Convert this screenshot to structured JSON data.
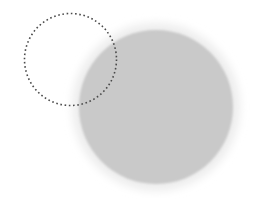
{
  "canvas": {
    "width": 253,
    "height": 199,
    "background_color": "#ffffff",
    "label": "image-canvas"
  },
  "shapes": {
    "filled_circle": {
      "name": "gray-filled-circle",
      "cx": 156,
      "cy": 107,
      "r": 77,
      "fill_color": "#c9c9c9",
      "edge_blur_px": 2
    },
    "halo_ring": {
      "name": "light-halo-ring",
      "cx": 156,
      "cy": 107,
      "r": 84,
      "fill_color": "#ededed",
      "blur_px": 4
    },
    "dotted_circle": {
      "name": "dotted-selection-circle",
      "cx": 70.5,
      "cy": 59.5,
      "r": 46,
      "stroke_color": "#4a4a4a",
      "stroke_width": 1.6,
      "dash_on": 1.6,
      "dash_off": 2.7,
      "dot_count": 68
    }
  }
}
